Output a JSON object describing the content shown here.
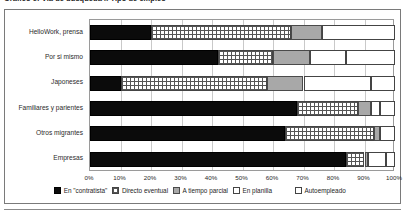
{
  "chart_data": {
    "type": "bar",
    "subtype": "stacked-horizontal-100",
    "title": "Gráfico 6: Vía de búsqueda x Tipo de empleo",
    "xlabel": "",
    "ylabel": "",
    "xlim": [
      0,
      100
    ],
    "xticks": [
      "0%",
      "10%",
      "20%",
      "30%",
      "40%",
      "50%",
      "60%",
      "70%",
      "80%",
      "90%",
      "100%"
    ],
    "xtick_values": [
      0,
      10,
      20,
      30,
      40,
      50,
      60,
      70,
      80,
      90,
      100
    ],
    "grid": true,
    "legend_position": "bottom",
    "categories": [
      "HelloWork, prensa",
      "Por si mismo",
      "Japoneses",
      "Familiares y parientes",
      "Otros migrantes",
      "Empresas"
    ],
    "series": [
      {
        "name": "En \"contratista\"",
        "pattern": "solid-black",
        "color": "#0b0b0b",
        "values": [
          20,
          42,
          10,
          68,
          64,
          84
        ]
      },
      {
        "name": "Directo eventual",
        "pattern": "grid",
        "color": "#ffffff",
        "values": [
          46,
          18,
          48,
          20,
          29,
          6
        ]
      },
      {
        "name": "A tiempo parcial",
        "pattern": "gray",
        "color": "#a8a8a8",
        "values": [
          10,
          12,
          12,
          4,
          2,
          1
        ]
      },
      {
        "name": "En planilla",
        "pattern": "dots",
        "color": "#ffffff",
        "values": [
          24,
          12,
          22,
          3,
          5,
          6
        ]
      },
      {
        "name": "Autoempleado",
        "pattern": "white",
        "color": "#ffffff",
        "values": [
          0,
          16,
          8,
          5,
          0,
          3
        ]
      }
    ]
  }
}
